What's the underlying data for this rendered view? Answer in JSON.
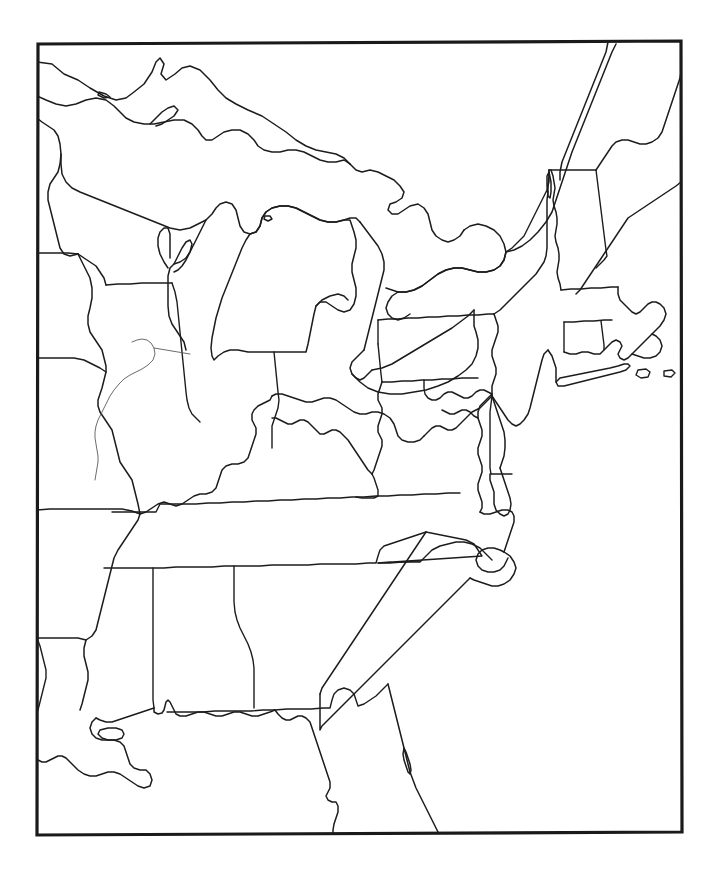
{
  "document": {
    "title": "Eastern United States Outline Map",
    "type": "blank-outline-map",
    "region": "Eastern United States",
    "has_labels": false,
    "has_legend": false,
    "has_title_text": false,
    "has_scale_bar": false,
    "has_compass_rose": false,
    "background_color": "#ffffff",
    "line_color": "#1c1c1c",
    "frame_color": "#1a1a1a",
    "river_color": "#5a5a5a",
    "page_width": 717,
    "page_height": 878
  },
  "frame": {
    "name": "map-border-rectangle",
    "left": 37,
    "top": 42,
    "right": 682,
    "bottom": 834,
    "stroke_width": 3.2,
    "note": "Slightly tilted rectangular neatline enclosing the map"
  },
  "map": {
    "projection_note": "Conic-like projection of eastern North America",
    "extent_description": "From western Minnesota/Iowa/Missouri/Arkansas east to the Atlantic, and from Lake Superior / Maine south to the Florida peninsula and Gulf of Mexico",
    "features": {
      "great_lakes": [
        "Lake Superior",
        "Lake Michigan",
        "Lake Huron",
        "Lake Erie",
        "Lake Ontario",
        "Lake Champlain",
        "Georgian Bay"
      ],
      "water_bodies": [
        "Atlantic Ocean",
        "Gulf of Mexico",
        "Chesapeake Bay",
        "Delaware Bay",
        "Long Island Sound",
        "Cape Cod Bay",
        "Albemarle Sound",
        "Pamlico Sound"
      ],
      "rivers_drawn": [
        "Illinois River"
      ],
      "islands": [
        "Long Island",
        "Martha's Vineyard",
        "Nantucket",
        "Cape Cod"
      ],
      "peninsulas": [
        "Upper Peninsula of Michigan",
        "Lower Peninsula of Michigan",
        "Delmarva Peninsula",
        "Florida Peninsula",
        "Door Peninsula"
      ]
    },
    "states_shown": [
      "Minnesota",
      "Iowa",
      "Missouri",
      "Arkansas",
      "Louisiana",
      "Wisconsin",
      "Illinois",
      "Michigan",
      "Indiana",
      "Ohio",
      "Kentucky",
      "Tennessee",
      "Mississippi",
      "Alabama",
      "Georgia",
      "Florida",
      "South Carolina",
      "North Carolina",
      "Virginia",
      "West Virginia",
      "Maryland",
      "Delaware",
      "Pennsylvania",
      "New Jersey",
      "New York",
      "Connecticut",
      "Rhode Island",
      "Massachusetts",
      "Vermont",
      "New Hampshire",
      "Maine"
    ],
    "state_count": 31
  }
}
